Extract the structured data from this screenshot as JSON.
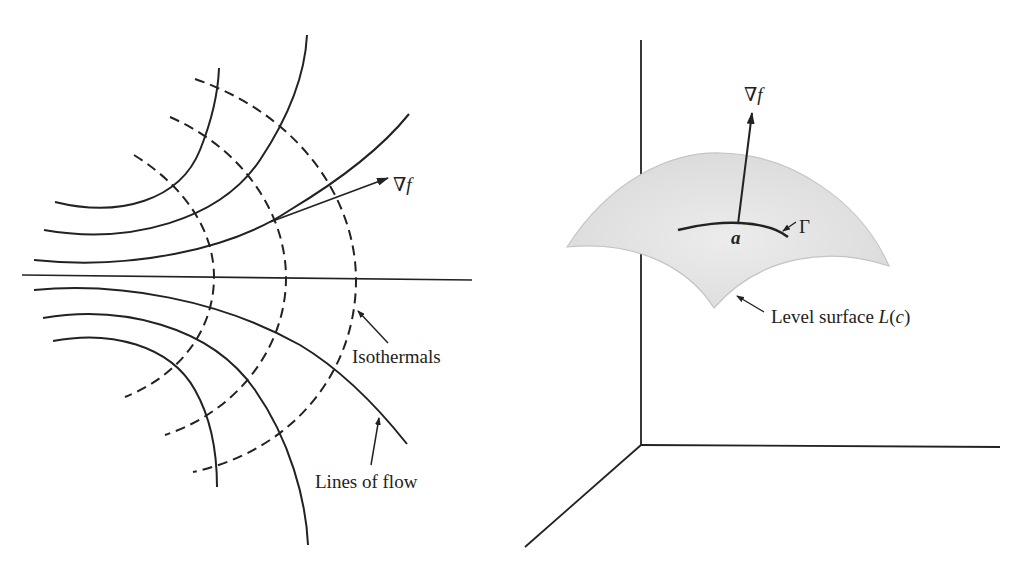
{
  "figure_left": {
    "gradient_label_symbol": "∇",
    "gradient_label_var": "f",
    "isotherm_label": "Isothermals",
    "flow_label": "Lines of flow"
  },
  "figure_right": {
    "gradient_label_symbol": "∇",
    "gradient_label_var": "f",
    "point_label": "a",
    "curve_label": "Γ",
    "surface_label_prefix": "Level surface ",
    "surface_label_fn": "L",
    "surface_label_open": "(",
    "surface_label_arg": "c",
    "surface_label_close": ")"
  },
  "colors": {
    "ink": "#222222",
    "surface_fill": "#e3e3e3",
    "surface_edge": "#c4c4c4",
    "background": "#ffffff"
  }
}
